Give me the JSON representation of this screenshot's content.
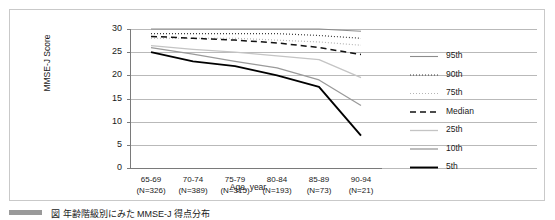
{
  "figure": {
    "caption_text": "図 年齢階級別にみた MMSE-J 得点分布",
    "caption_badge": "figure-number-badge"
  },
  "chart_data": {
    "type": "line",
    "title": "",
    "xlabel": "Age, year",
    "ylabel": "MMSE-J Score",
    "ylim": [
      0,
      30
    ],
    "yticks": [
      30,
      25,
      20,
      15,
      10,
      5,
      0
    ],
    "grid": true,
    "legend_position": "right",
    "categories": [
      "65-69",
      "70-74",
      "75-79",
      "80-84",
      "85-89",
      "90-94"
    ],
    "category_counts": [
      "(N=326)",
      "(N=389)",
      "(N=315)",
      "(N=193)",
      "(N=73)",
      "(N=21)"
    ],
    "xtick_labels": [
      "65-69\n(N=326)",
      "70-74\n(N=389)",
      "75-79\n(N=315)",
      "80-84\n(N=193)",
      "85-89\n(N=73)",
      "90-94\n(N=21)"
    ],
    "series": [
      {
        "name": "95th",
        "values": [
          30.0,
          30.0,
          30.0,
          30.0,
          30.0,
          29.5
        ],
        "color": "#8c8c8c",
        "style": "solid",
        "width": 1.1
      },
      {
        "name": "90th",
        "values": [
          29.0,
          29.0,
          29.0,
          29.0,
          28.6,
          28.0
        ],
        "color": "#3a3a3a",
        "style": "dotted",
        "width": 1.2
      },
      {
        "name": "75th",
        "values": [
          28.0,
          28.0,
          28.0,
          27.6,
          27.2,
          26.5
        ],
        "color": "#b5b5b5",
        "style": "dotted",
        "width": 1.2
      },
      {
        "name": "Median",
        "values": [
          28.4,
          28.0,
          27.6,
          27.0,
          26.0,
          24.5
        ],
        "color": "#111111",
        "style": "dashed",
        "width": 1.5
      },
      {
        "name": "25th",
        "values": [
          26.4,
          25.6,
          25.0,
          24.2,
          23.4,
          19.5
        ],
        "color": "#c4c4c4",
        "style": "solid",
        "width": 1.3
      },
      {
        "name": "10th",
        "values": [
          26.0,
          24.6,
          23.0,
          21.6,
          19.0,
          13.5
        ],
        "color": "#9a9a9a",
        "style": "solid",
        "width": 1.3
      },
      {
        "name": "5th",
        "values": [
          25.0,
          23.0,
          22.0,
          20.0,
          17.5,
          7.0
        ],
        "color": "#000000",
        "style": "solid",
        "width": 1.9
      }
    ]
  }
}
